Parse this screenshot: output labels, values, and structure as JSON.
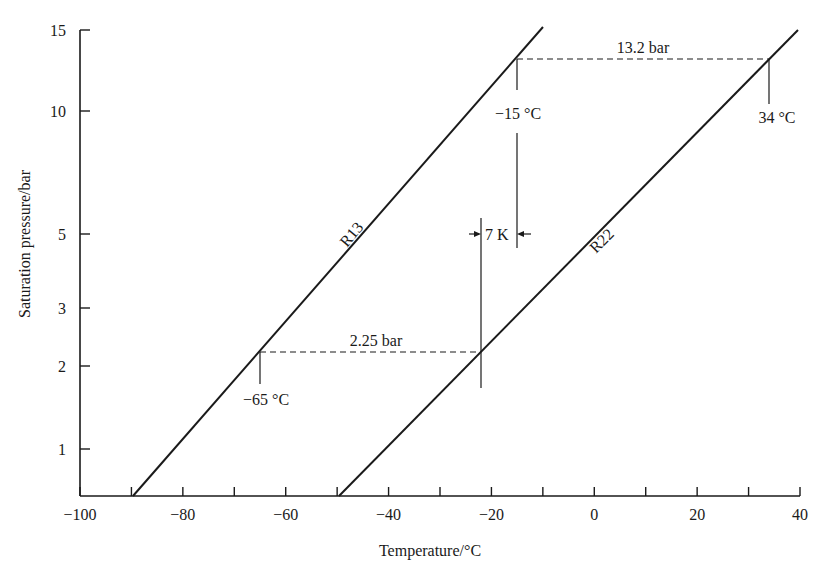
{
  "chart_data": {
    "type": "line",
    "title": "",
    "xlabel": "Temperature/°C",
    "ylabel": "Saturation pressure/bar",
    "xlim": [
      -100,
      40
    ],
    "ylim": [
      0.5,
      15
    ],
    "yscale": "log-like (saturation pressure)",
    "grid": false,
    "x_ticks": [
      -100,
      -90,
      -80,
      -70,
      -60,
      -50,
      -40,
      -30,
      -20,
      -10,
      0,
      10,
      20,
      30,
      40
    ],
    "x_tick_labels": [
      "-100",
      "-80",
      "-60",
      "-40",
      "-20",
      "0",
      "20",
      "40"
    ],
    "y_ticks": [
      1,
      2,
      3,
      5,
      10,
      15
    ],
    "y_tick_labels": [
      "1",
      "2",
      "3",
      "5",
      "10",
      "15"
    ],
    "series": [
      {
        "name": "R13",
        "x": [
          -89,
          -65,
          -15,
          -10
        ],
        "y": [
          0.5,
          2.25,
          13.2,
          15
        ],
        "label": "R13"
      },
      {
        "name": "R22",
        "x": [
          -49,
          -22,
          34,
          40
        ],
        "y": [
          0.5,
          2.25,
          13.2,
          15
        ],
        "label": "R22"
      }
    ],
    "annotations": [
      {
        "text": "13.2 bar",
        "type": "dashed-horizontal",
        "y": 13.2,
        "x_from": -15,
        "x_to": 34
      },
      {
        "text": "2.25 bar",
        "type": "dashed-horizontal",
        "y": 2.25,
        "x_from": -65,
        "x_to": -22
      },
      {
        "text": "−15 °C",
        "type": "point-label",
        "x": -15,
        "y": 13.2
      },
      {
        "text": "34 °C",
        "type": "point-label",
        "x": 34,
        "y": 13.2
      },
      {
        "text": "−65 °C",
        "type": "point-label",
        "x": -65,
        "y": 2.25
      },
      {
        "text": "7 K",
        "type": "dimension",
        "x_from": -22,
        "x_to": -15
      }
    ]
  },
  "labels": {
    "xlabel": "Temperature/°C",
    "ylabel": "Saturation pressure/bar",
    "r13": "R13",
    "r22": "R22",
    "p_high": "13.2 bar",
    "p_low": "2.25 bar",
    "t_m15": "−15 °C",
    "t_34": "34 °C",
    "t_m65": "−65 °C",
    "dt": "7 K"
  },
  "layout": {
    "x_px": {
      "min": -100,
      "max": 40,
      "px_min": 80,
      "px_max": 800
    },
    "y_px": {
      "15": 30,
      "10": 111,
      "5": 234,
      "3": 308,
      "2": 366,
      "1": 449,
      "bottom": 496
    },
    "line_color": "#1a1a1a"
  }
}
